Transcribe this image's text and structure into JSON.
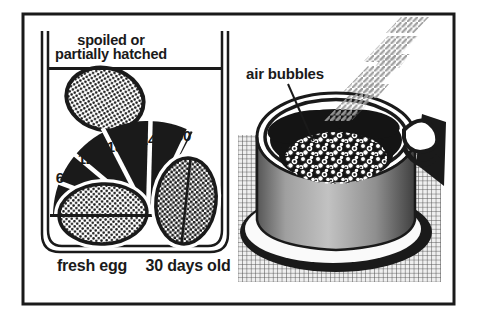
{
  "diagram": {
    "left_panel": {
      "float_caption_line1": "spoiled or",
      "float_caption_line2": "partially hatched",
      "age_scale_days": [
        "6",
        "12",
        "18",
        "24",
        "30"
      ],
      "fresh_egg_label": "fresh egg",
      "old_egg_label": "30 days old"
    },
    "right_panel": {
      "air_bubbles_label": "air bubbles"
    },
    "colors": {
      "ink": "#1a1a1a",
      "paper": "#ffffff",
      "water_dark": "#141414",
      "pot_gray_light": "#c2c2c2",
      "pot_gray_dark": "#3f3f3f",
      "steam_gray": "#9b9b9b",
      "mat_line": "#4f4f4f",
      "mat_bg": "#efefef"
    }
  }
}
